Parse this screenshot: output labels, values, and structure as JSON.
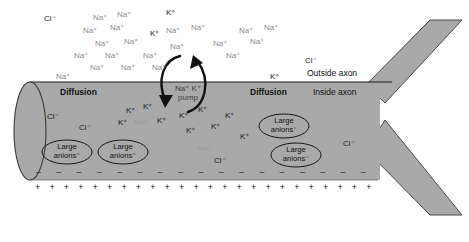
{
  "diagram": {
    "colors": {
      "axon_fill": "#a9a9a9",
      "axon_outline": "#3a3a3a",
      "background": "#ffffff",
      "text": "#1a1a1a",
      "faint_ion": "#8c8c8c"
    },
    "region_labels": {
      "outside_axon": "Outside axon",
      "inside_axon": "Inside axon",
      "diffusion_left": "Diffusion",
      "diffusion_right": "Diffusion"
    },
    "pump": {
      "line1": "Na⁺  K⁺",
      "line2": "pump",
      "na_label": "Na⁺",
      "k_label": "K⁺",
      "pump_word": "pump",
      "arrow_in_name": "sodium-influx-arrow",
      "arrow_out_name": "potassium-efflux-arrow"
    },
    "membrane_charges": {
      "inside_symbol": "–",
      "outside_symbol": "+",
      "inside_count": 17,
      "outside_count": 24,
      "inside_polarity": "negative",
      "outside_polarity": "positive"
    },
    "large_anions": [
      {
        "line1": "Large",
        "line2": "anions⁻",
        "x": 43,
        "y": 143
      },
      {
        "line1": "Large",
        "line2": "anions⁻",
        "x": 99,
        "y": 143
      },
      {
        "line1": "Large",
        "line2": "anions⁻",
        "x": 260,
        "y": 117
      },
      {
        "line1": "Large",
        "line2": "anions⁻",
        "x": 272,
        "y": 146
      }
    ],
    "outside_ions": [
      {
        "label": "Cl⁻",
        "x": 44,
        "y": 15,
        "style": "dark"
      },
      {
        "label": "Na⁺",
        "x": 93,
        "y": 14,
        "style": "faint"
      },
      {
        "label": "Na⁺",
        "x": 117,
        "y": 11,
        "style": "faint"
      },
      {
        "label": "K⁺",
        "x": 166,
        "y": 9,
        "style": "dark"
      },
      {
        "label": "Na⁺",
        "x": 83,
        "y": 27,
        "style": "faint"
      },
      {
        "label": "Na⁺",
        "x": 110,
        "y": 24,
        "style": "faint"
      },
      {
        "label": "K⁺",
        "x": 150,
        "y": 30,
        "style": "dark"
      },
      {
        "label": "Na⁺",
        "x": 166,
        "y": 27,
        "style": "faint"
      },
      {
        "label": "Na⁺",
        "x": 191,
        "y": 24,
        "style": "faint"
      },
      {
        "label": "Na⁺",
        "x": 239,
        "y": 27,
        "style": "faint"
      },
      {
        "label": "Na⁺",
        "x": 264,
        "y": 24,
        "style": "faint"
      },
      {
        "label": "Na⁺",
        "x": 95,
        "y": 40,
        "style": "faint"
      },
      {
        "label": "Na⁺",
        "x": 124,
        "y": 38,
        "style": "faint"
      },
      {
        "label": "Na⁺",
        "x": 170,
        "y": 43,
        "style": "faint"
      },
      {
        "label": "Na⁺",
        "x": 213,
        "y": 40,
        "style": "faint"
      },
      {
        "label": "Na⁺",
        "x": 250,
        "y": 38,
        "style": "faint"
      },
      {
        "label": "Na⁺",
        "x": 74,
        "y": 52,
        "style": "faint"
      },
      {
        "label": "Na⁺",
        "x": 105,
        "y": 52,
        "style": "faint"
      },
      {
        "label": "Na⁺",
        "x": 143,
        "y": 52,
        "style": "faint"
      },
      {
        "label": "Na⁺",
        "x": 226,
        "y": 52,
        "style": "faint"
      },
      {
        "label": "Cl⁻",
        "x": 305,
        "y": 57,
        "style": "dark"
      },
      {
        "label": "Na⁺",
        "x": 90,
        "y": 64,
        "style": "faint"
      },
      {
        "label": "Na⁺",
        "x": 121,
        "y": 64,
        "style": "faint"
      },
      {
        "label": "Na⁺",
        "x": 152,
        "y": 64,
        "style": "faint"
      },
      {
        "label": "Na⁺",
        "x": 56,
        "y": 73,
        "style": "faint"
      },
      {
        "label": "K⁺",
        "x": 270,
        "y": 73,
        "style": "dark"
      }
    ],
    "inside_ions": [
      {
        "label": "Cl⁻",
        "x": 47,
        "y": 113,
        "style": "dark"
      },
      {
        "label": "Cl⁻",
        "x": 79,
        "y": 124,
        "style": "dark"
      },
      {
        "label": "K⁺",
        "x": 126,
        "y": 107,
        "style": "dark"
      },
      {
        "label": "K⁺",
        "x": 143,
        "y": 103,
        "style": "dark"
      },
      {
        "label": "K⁺",
        "x": 118,
        "y": 119,
        "style": "dark"
      },
      {
        "label": "Na⁺",
        "x": 134,
        "y": 119,
        "style": "faint2"
      },
      {
        "label": "K⁺",
        "x": 157,
        "y": 117,
        "style": "dark"
      },
      {
        "label": "K⁺",
        "x": 179,
        "y": 112,
        "style": "dark"
      },
      {
        "label": "K⁺",
        "x": 198,
        "y": 106,
        "style": "dark"
      },
      {
        "label": "K⁺",
        "x": 186,
        "y": 127,
        "style": "dark"
      },
      {
        "label": "K⁺",
        "x": 211,
        "y": 123,
        "style": "dark"
      },
      {
        "label": "K⁺",
        "x": 225,
        "y": 112,
        "style": "dark"
      },
      {
        "label": "Na⁺",
        "x": 198,
        "y": 145,
        "style": "faint2"
      },
      {
        "label": "Cl⁻",
        "x": 214,
        "y": 157,
        "style": "dark"
      },
      {
        "label": "K⁺",
        "x": 240,
        "y": 133,
        "style": "dark"
      },
      {
        "label": "Cl⁻",
        "x": 343,
        "y": 140,
        "style": "dark"
      }
    ]
  }
}
